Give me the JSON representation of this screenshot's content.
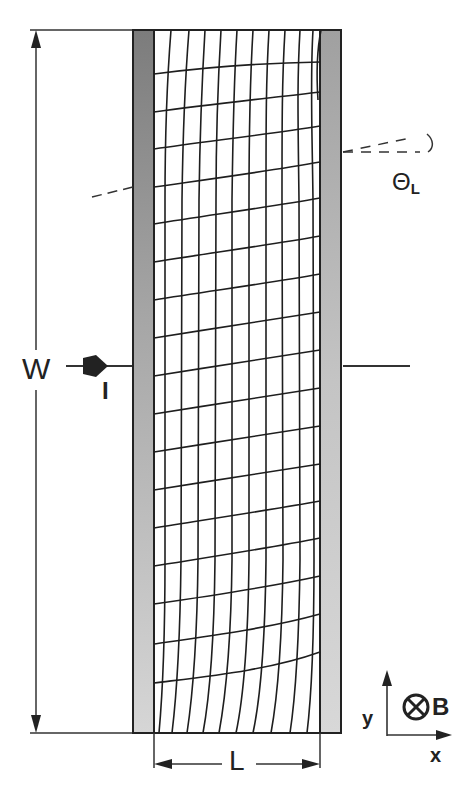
{
  "figure": {
    "labels": {
      "width": "W",
      "current": "I",
      "length": "L",
      "hall_angle_symbol": "Θ",
      "hall_angle_subscript": "L",
      "axis_y": "y",
      "axis_x": "x",
      "magnetic_field": "B"
    },
    "icons": {
      "current_arrow": "right-arrow",
      "field_into_page": "circle-cross",
      "axes": "xy-axes"
    },
    "colors": {
      "line": "#222222",
      "contact_dark": "#8a8a8a",
      "contact_light": "#cfcfcf",
      "background": "#ffffff"
    },
    "mesh": {
      "vertical_lines": 11,
      "horizontal_lines": 17
    }
  }
}
